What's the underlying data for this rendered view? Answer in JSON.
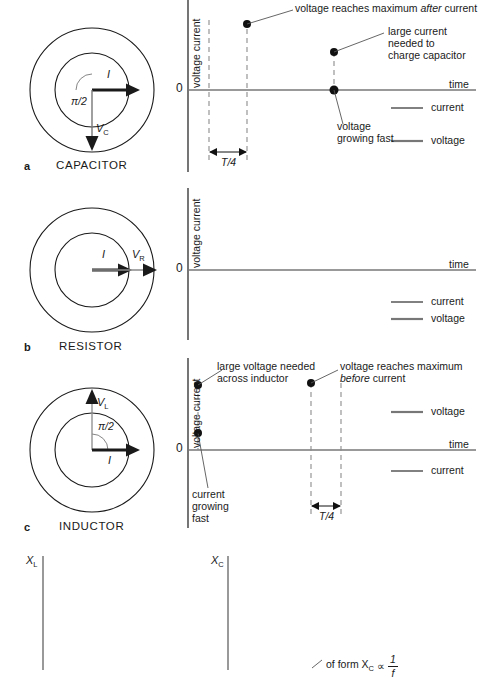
{
  "figure": {
    "stroke_color": "#1a1a1a",
    "voltage_color": "#6e6e6e",
    "current_color": "#1a1a1a"
  },
  "panels": [
    {
      "key": "a",
      "tag": "a",
      "component_label": "CAPACITOR",
      "phasor": {
        "arrows": [
          {
            "name": "current",
            "label": "I",
            "direction": "right",
            "weight": "thick"
          },
          {
            "name": "voltage",
            "label": "V",
            "sub": "C",
            "direction": "down",
            "weight": "thin"
          }
        ],
        "angle_label": "π/2"
      },
      "graph": {
        "ylabel": "voltage current",
        "zero_label": "0",
        "time_label": "time",
        "period_label": "T/4",
        "annotations": [
          {
            "name": "voltage-max-after-current",
            "text_runs": [
              {
                "t": "voltage reaches maximum ",
                "italic": false
              },
              {
                "t": "after",
                "italic": true
              },
              {
                "t": " current",
                "italic": false
              }
            ]
          },
          {
            "name": "large-current-needed",
            "lines": [
              "large current",
              "needed to",
              "charge capacitor"
            ]
          },
          {
            "name": "voltage-growing-fast",
            "lines": [
              "voltage",
              "growing fast"
            ]
          }
        ],
        "legend": [
          {
            "name": "current",
            "label": "current",
            "weight": "thin"
          },
          {
            "name": "voltage",
            "label": "voltage",
            "weight": "thick"
          }
        ]
      }
    },
    {
      "key": "b",
      "tag": "b",
      "component_label": "RESISTOR",
      "phasor": {
        "arrows": [
          {
            "name": "current",
            "label": "I",
            "direction": "right",
            "weight": "thick"
          },
          {
            "name": "voltage",
            "label": "V",
            "sub": "R",
            "direction": "right",
            "weight": "thin"
          }
        ],
        "angle_label": ""
      },
      "graph": {
        "ylabel": "voltage current",
        "zero_label": "0",
        "time_label": "time",
        "period_label": "",
        "annotations": [],
        "legend": [
          {
            "name": "current",
            "label": "current",
            "weight": "thin"
          },
          {
            "name": "voltage",
            "label": "voltage",
            "weight": "thick"
          }
        ]
      }
    },
    {
      "key": "c",
      "tag": "c",
      "component_label": "INDUCTOR",
      "phasor": {
        "arrows": [
          {
            "name": "voltage",
            "label": "V",
            "sub": "L",
            "direction": "up",
            "weight": "thin"
          },
          {
            "name": "current",
            "label": "I",
            "direction": "right",
            "weight": "thick"
          }
        ],
        "angle_label": "π/2"
      },
      "graph": {
        "ylabel": "voltage current",
        "zero_label": "0",
        "time_label": "time",
        "period_label": "T/4",
        "annotations": [
          {
            "name": "large-voltage-needed",
            "lines": [
              "large voltage needed",
              "across inductor"
            ]
          },
          {
            "name": "voltage-max-before-current",
            "line1_runs": [
              {
                "t": "voltage reaches maximum",
                "italic": false
              }
            ],
            "line2_runs": [
              {
                "t": "before",
                "italic": true
              },
              {
                "t": " current",
                "italic": false
              }
            ]
          },
          {
            "name": "current-growing-fast",
            "lines": [
              "current",
              "growing",
              "fast"
            ]
          }
        ],
        "legend": [
          {
            "name": "voltage",
            "label": "voltage",
            "weight": "thick"
          },
          {
            "name": "current",
            "label": "current",
            "weight": "thin"
          }
        ]
      }
    }
  ],
  "bottom": {
    "left_axis_label": "X",
    "left_axis_sub": "L",
    "right_axis_label": "X",
    "right_axis_sub": "C",
    "formula": {
      "prefix": "of form X",
      "sub": "C",
      "prop": "∝",
      "numerator": "1",
      "denominator": "f"
    }
  }
}
